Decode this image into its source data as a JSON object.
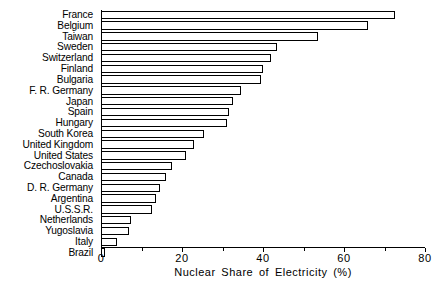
{
  "chart_data": {
    "type": "bar",
    "orientation": "horizontal",
    "title": "",
    "xlabel": "Nuclear Share of Electricity (%)",
    "ylabel": "",
    "xlim": [
      0,
      80
    ],
    "xticks": [
      0,
      20,
      40,
      60,
      80
    ],
    "xtick_labels": [
      "0",
      "20",
      "40",
      "60",
      "80"
    ],
    "grid": false,
    "legend": null,
    "categories": [
      "France",
      "Belgium",
      "Taiwan",
      "Sweden",
      "Switzerland",
      "Finland",
      "Bulgaria",
      "F. R. Germany",
      "Japan",
      "Spain",
      "Hungary",
      "South Korea",
      "United Kingdom",
      "United States",
      "Czechoslovakia",
      "Canada",
      "D. R. Germany",
      "Argentina",
      "U.S.S.R.",
      "Netherlands",
      "Yugoslavia",
      "Italy",
      "Brazil"
    ],
    "values": [
      72.5,
      66.0,
      53.5,
      43.5,
      42.0,
      40.0,
      39.5,
      34.5,
      32.5,
      31.5,
      31.0,
      25.5,
      23.0,
      21.0,
      17.5,
      16.0,
      14.5,
      13.5,
      12.5,
      7.5,
      7.0,
      4.0,
      1.0
    ],
    "bar_style": {
      "fill": "#ffffff",
      "edge": "#000000"
    }
  },
  "axis": {
    "title": "Nuclear Share of Electricity (%)"
  }
}
